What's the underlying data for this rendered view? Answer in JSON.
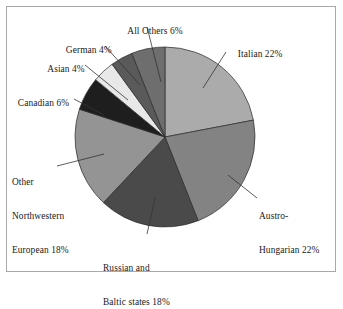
{
  "figure": {
    "title": "",
    "background_color": "#ffffff",
    "frame_color": "#a8a8a8"
  },
  "chart_data": {
    "type": "pie",
    "title": "",
    "xlabel": "",
    "ylabel": "",
    "legend_position": "none",
    "grid": false,
    "start_angle_deg": 90,
    "direction": "clockwise",
    "categories": [
      "Italian",
      "Austro-Hungarian",
      "Russian and Baltic states",
      "Other Northwestern European",
      "Canadian",
      "Asian",
      "German",
      "All Others"
    ],
    "values": [
      22,
      22,
      18,
      18,
      6,
      4,
      4,
      6
    ],
    "unit": "%",
    "colors": [
      "#ababab",
      "#838383",
      "#4a4a4a",
      "#949494",
      "#1e1e1e",
      "#e8e8e8",
      "#5a5a5a",
      "#6e6e6e"
    ],
    "slices": [
      {
        "name": "Italian",
        "value": 22,
        "color": "#ababab",
        "label": "Italian 22%"
      },
      {
        "name": "Austro-Hungarian",
        "value": 22,
        "color": "#838383",
        "label": "Austro-Hungarian 22%"
      },
      {
        "name": "Russian and Baltic states",
        "value": 18,
        "color": "#4a4a4a",
        "label": "Russian and Baltic states 18%"
      },
      {
        "name": "Other Northwestern European",
        "value": 18,
        "color": "#949494",
        "label": "Other Northwestern European 18%"
      },
      {
        "name": "Canadian",
        "value": 6,
        "color": "#1e1e1e",
        "label": "Canadian 6%"
      },
      {
        "name": "Asian",
        "value": 4,
        "color": "#e8e8e8",
        "label": "Asian 4%"
      },
      {
        "name": "German",
        "value": 4,
        "color": "#5a5a5a",
        "label": "German 4%"
      },
      {
        "name": "All Others",
        "value": 6,
        "color": "#6e6e6e",
        "label": "All Others 6%"
      }
    ]
  },
  "labels": {
    "all_others": "All Others 6%",
    "german": "German 4%",
    "asian": "Asian 4%",
    "canadian": "Canadian 6%",
    "other_northwestern_line1": "Other",
    "other_northwestern_line2": "Northwestern",
    "other_northwestern_line3": "European 18%",
    "russian_line1": "Russian and",
    "russian_line2": "Baltic states 18%",
    "italian": "Italian 22%",
    "austro_line1": "Austro-",
    "austro_line2": "Hungarian 22%"
  }
}
